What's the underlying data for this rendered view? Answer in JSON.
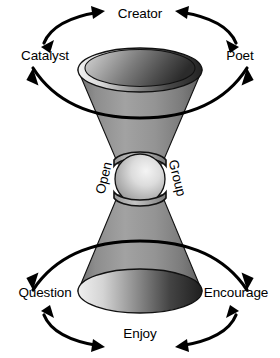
{
  "diagram": {
    "type": "double-cone-hourglass",
    "title": "",
    "background_color": "#ffffff",
    "line_color": "#000000",
    "shape_light": "#e8e8e8",
    "shape_mid": "#9a9a9a",
    "shape_dark": "#3a3a3a",
    "shape_darkest": "#262626",
    "labels": {
      "top_center": "Creator",
      "top_left": "Catalyst",
      "top_right": "Poet",
      "middle_left": "Open",
      "middle_right": "Group",
      "bottom_left": "Question",
      "bottom_right": "Encourage",
      "bottom_center": "Enjoy"
    },
    "arrows": [
      {
        "name": "catalyst-to-creator",
        "heads": "double",
        "orientation": "arc-upper-left"
      },
      {
        "name": "creator-to-poet",
        "heads": "double",
        "orientation": "arc-upper-right"
      },
      {
        "name": "top-orbit",
        "heads": "double",
        "orientation": "ellipse-around-upper-cone"
      },
      {
        "name": "bottom-orbit",
        "heads": "double",
        "orientation": "ellipse-around-lower-cone"
      },
      {
        "name": "question-to-enjoy",
        "heads": "double",
        "orientation": "arc-lower-left"
      },
      {
        "name": "enjoy-to-encourage",
        "heads": "double",
        "orientation": "arc-lower-right"
      }
    ],
    "elements": [
      {
        "name": "upper-cone",
        "shape": "inverted-cone"
      },
      {
        "name": "center-sphere",
        "shape": "sphere"
      },
      {
        "name": "lower-cone",
        "shape": "cone"
      }
    ]
  }
}
